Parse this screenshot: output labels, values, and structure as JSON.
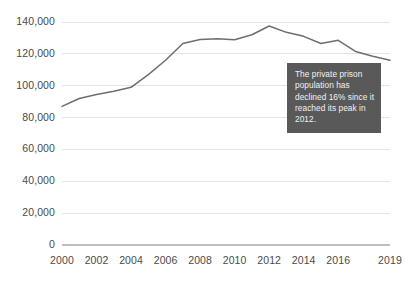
{
  "chart_data": {
    "type": "line",
    "title": "",
    "xlabel": "",
    "ylabel": "",
    "x": [
      2000,
      2001,
      2002,
      2003,
      2004,
      2005,
      2006,
      2007,
      2008,
      2009,
      2010,
      2011,
      2012,
      2013,
      2014,
      2015,
      2016,
      2017,
      2018,
      2019
    ],
    "values": [
      87000,
      92000,
      94500,
      96500,
      99000,
      107000,
      116000,
      126500,
      129000,
      129500,
      128800,
      132000,
      137500,
      133500,
      131000,
      126500,
      128500,
      121500,
      118500,
      116000
    ],
    "series": [
      {
        "name": "Private prison population",
        "values": [
          87000,
          92000,
          94500,
          96500,
          99000,
          107000,
          116000,
          126500,
          129000,
          129500,
          128800,
          132000,
          137500,
          133500,
          131000,
          126500,
          128500,
          121500,
          118500,
          116000
        ]
      }
    ],
    "x_tick_labels": [
      "2000",
      "2002",
      "2004",
      "2006",
      "2008",
      "2010",
      "2012",
      "2014",
      "2016",
      "2019"
    ],
    "x_tick_values": [
      2000,
      2002,
      2004,
      2006,
      2008,
      2010,
      2012,
      2014,
      2016,
      2019
    ],
    "y_tick_labels": [
      "0",
      "20,000",
      "40,000",
      "60,000",
      "80,000",
      "100,000",
      "120,000",
      "140,000"
    ],
    "y_tick_values": [
      0,
      20000,
      40000,
      60000,
      80000,
      100000,
      120000,
      140000
    ],
    "ylim": [
      0,
      140000
    ],
    "xlim": [
      2000,
      2019
    ],
    "grid": true,
    "legend": "none",
    "line_color": "#6e6e6e",
    "grid_color": "#e3e3e3",
    "axis_color": "#bfbfbf",
    "annotations": [
      {
        "text": "The private prison population has declined 16% since it reached its peak in 2012.",
        "background_color": "#595959",
        "text_color": "#f2f2f2"
      }
    ]
  },
  "annotation": {
    "text": "The private prison population has declined 16% since it reached its peak in 2012."
  }
}
